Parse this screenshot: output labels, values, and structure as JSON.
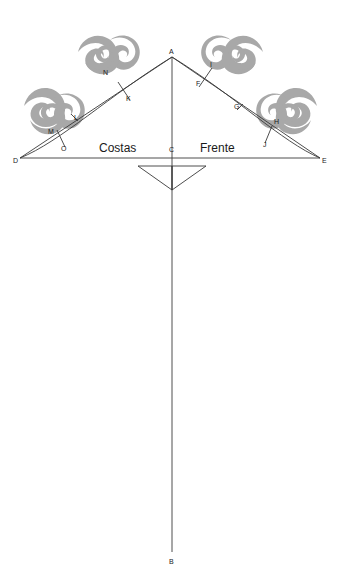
{
  "diagram": {
    "side_labels": {
      "left": "Costas",
      "right": "Frente"
    },
    "colors": {
      "line": "#3a3a3a",
      "label": "#222222",
      "ornament": "#a8a8a8",
      "background": "#ffffff"
    },
    "points": [
      {
        "id": "A",
        "label": "A",
        "x": 172,
        "y": 57,
        "lx": 169,
        "ly": 54
      },
      {
        "id": "B",
        "label": "B",
        "x": 172,
        "y": 552,
        "lx": 169,
        "ly": 564
      },
      {
        "id": "C",
        "label": "C",
        "x": 172,
        "y": 158,
        "lx": 169,
        "ly": 150
      },
      {
        "id": "D",
        "label": "D",
        "x": 20,
        "y": 158,
        "lx": 14,
        "ly": 162
      },
      {
        "id": "E",
        "label": "E",
        "x": 320,
        "y": 158,
        "lx": 322,
        "ly": 162
      },
      {
        "id": "F",
        "label": "F",
        "x": 199,
        "y": 87,
        "lx": 196,
        "ly": 85
      },
      {
        "id": "G",
        "label": "G",
        "x": 237,
        "y": 110,
        "lx": 234,
        "ly": 108
      },
      {
        "id": "H",
        "label": "H",
        "x": 272,
        "y": 126,
        "lx": 274,
        "ly": 124
      },
      {
        "id": "I",
        "label": "I",
        "x": 212,
        "y": 68,
        "lx": 210,
        "ly": 66
      },
      {
        "id": "J",
        "label": "J",
        "x": 265,
        "y": 143,
        "lx": 263,
        "ly": 146
      },
      {
        "id": "K",
        "label": "K",
        "x": 130,
        "y": 100,
        "lx": 127,
        "ly": 99
      },
      {
        "id": "L",
        "label": "L",
        "x": 78,
        "y": 121,
        "lx": 76,
        "ly": 119
      },
      {
        "id": "M",
        "label": "M",
        "x": 57,
        "y": 130,
        "lx": 49,
        "ly": 133
      },
      {
        "id": "N",
        "label": "N",
        "x": 108,
        "y": 73,
        "lx": 105,
        "ly": 72
      },
      {
        "id": "O",
        "label": "O",
        "x": 65,
        "y": 147,
        "lx": 62,
        "ly": 150
      }
    ]
  }
}
